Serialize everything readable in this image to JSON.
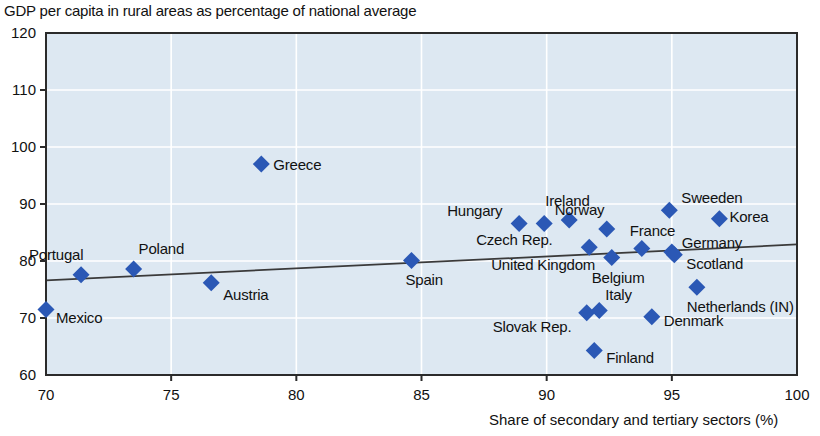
{
  "chart_data": {
    "type": "scatter",
    "title": "GDP per capita in rural areas as percentage of national average",
    "xlabel": "Share of secondary and tertiary sectors (%)",
    "ylabel": "",
    "xlim": [
      70,
      100
    ],
    "ylim": [
      60,
      120
    ],
    "xticks": [
      70,
      75,
      80,
      85,
      90,
      95,
      100
    ],
    "yticks": [
      60,
      70,
      80,
      90,
      100,
      110,
      120
    ],
    "grid": true,
    "legend": "none",
    "marker": "diamond",
    "marker_color": "#2b58b5",
    "plot_background": "#dde8f2",
    "trendline": {
      "label": "linear fit",
      "x": [
        70,
        100
      ],
      "y": [
        76.6,
        82.9
      ]
    },
    "points": [
      {
        "name": "Mexico",
        "x": 70.0,
        "y": 71.5,
        "label_dx": 10,
        "label_dy": 9
      },
      {
        "name": "Portugal",
        "x": 71.4,
        "y": 77.6,
        "label_dx": -52,
        "label_dy": -20
      },
      {
        "name": "Poland",
        "x": 73.5,
        "y": 78.6,
        "label_dx": 5,
        "label_dy": -20
      },
      {
        "name": "Austria",
        "x": 76.6,
        "y": 76.2,
        "label_dx": 12,
        "label_dy": 12
      },
      {
        "name": "Greece",
        "x": 78.6,
        "y": 97.0,
        "label_dx": 12,
        "label_dy": 1
      },
      {
        "name": "Spain",
        "x": 84.6,
        "y": 80.1,
        "label_dx": -6,
        "label_dy": 20
      },
      {
        "name": "Hungary",
        "x": 88.9,
        "y": 86.6,
        "label_dx": -72,
        "label_dy": -12
      },
      {
        "name": "Czech Rep.",
        "x": 89.9,
        "y": 86.6,
        "label_dx": -68,
        "label_dy": 17
      },
      {
        "name": "Ireland",
        "x": 90.9,
        "y": 87.2,
        "label_dx": -24,
        "label_dy": -19
      },
      {
        "name": "United Kingdom",
        "x": 91.7,
        "y": 82.4,
        "label_dx": -98,
        "label_dy": 18
      },
      {
        "name": "Slovak Rep.",
        "x": 91.6,
        "y": 70.9,
        "label_dx": -94,
        "label_dy": 14
      },
      {
        "name": "Italy",
        "x": 92.1,
        "y": 71.3,
        "label_dx": 6,
        "label_dy": -16
      },
      {
        "name": "Finland",
        "x": 91.9,
        "y": 64.3,
        "label_dx": 12,
        "label_dy": 8
      },
      {
        "name": "Norway",
        "x": 92.4,
        "y": 85.6,
        "label_dx": -52,
        "label_dy": -19
      },
      {
        "name": "Belgium",
        "x": 92.6,
        "y": 80.6,
        "label_dx": -20,
        "label_dy": 20
      },
      {
        "name": "France",
        "x": 93.8,
        "y": 82.2,
        "label_dx": -12,
        "label_dy": -17
      },
      {
        "name": "Denmark",
        "x": 94.2,
        "y": 70.2,
        "label_dx": 12,
        "label_dy": 4
      },
      {
        "name": "Sweeden",
        "x": 94.9,
        "y": 88.9,
        "label_dx": 12,
        "label_dy": -12
      },
      {
        "name": "Germany",
        "x": 95.0,
        "y": 81.6,
        "label_dx": 10,
        "label_dy": -9
      },
      {
        "name": "Scotland",
        "x": 95.1,
        "y": 81.1,
        "label_dx": 12,
        "label_dy": 9
      },
      {
        "name": "Netherlands (IN)",
        "x": 96.0,
        "y": 75.4,
        "label_dx": -10,
        "label_dy": 20
      },
      {
        "name": "Korea",
        "x": 96.9,
        "y": 87.4,
        "label_dx": 10,
        "label_dy": -2
      }
    ]
  }
}
